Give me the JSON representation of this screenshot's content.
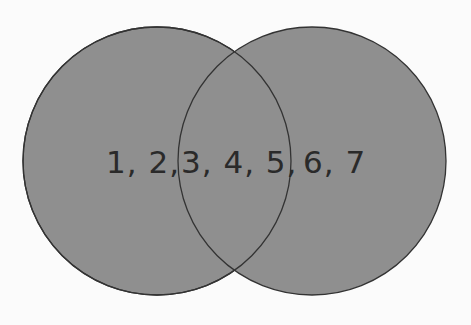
{
  "diagram": {
    "type": "venn",
    "sets": [
      {
        "id": "left",
        "only_elements": [
          "1",
          "2"
        ]
      },
      {
        "id": "right",
        "only_elements": [
          "6",
          "7"
        ]
      }
    ],
    "intersection_elements": [
      "3",
      "4",
      "5"
    ],
    "labels": {
      "left_only": "1, 2,",
      "intersection": "3, 4, 5,",
      "right_only": "6, 7"
    },
    "colors": {
      "fill": "#8f8f8f",
      "stroke": "#333333",
      "text": "#2a2a2a",
      "background": "#fbfbfb"
    }
  }
}
